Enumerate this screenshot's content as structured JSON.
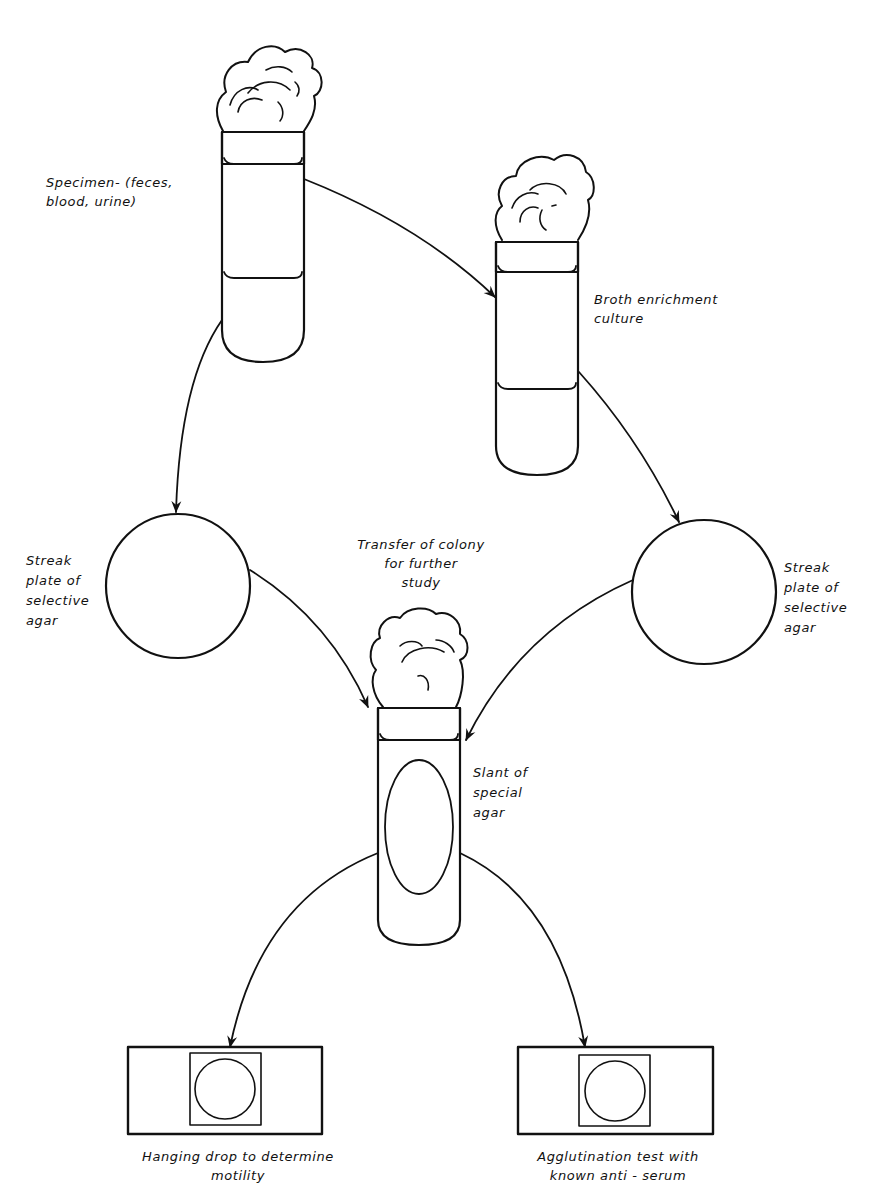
{
  "diagram": {
    "type": "flowchart",
    "colors": {
      "line": "#111111",
      "background": "#ffffff"
    },
    "nodes": {
      "specimen_tube": {
        "label": "Specimen- (feces,\nblood, urine)"
      },
      "broth_tube": {
        "label": "Broth enrichment\nculture"
      },
      "streak_left": {
        "label": "Streak\nplate of\nselective\nagar"
      },
      "streak_right": {
        "label": "Streak\nplate of\nselective\nagar"
      },
      "transfer_note": {
        "label": "Transfer of colony\nfor further\nstudy"
      },
      "slant_tube": {
        "label": "Slant of\nspecial\nagar"
      },
      "hanging_drop_slide": {
        "label": "Hanging drop to determine\nmotility"
      },
      "agglutination_slide": {
        "label": "Agglutination test with\nknown anti - serum"
      }
    },
    "edges": [
      {
        "from": "specimen_tube",
        "to": "broth_tube"
      },
      {
        "from": "specimen_tube",
        "to": "streak_left"
      },
      {
        "from": "broth_tube",
        "to": "streak_right"
      },
      {
        "from": "streak_left",
        "to": "slant_tube"
      },
      {
        "from": "streak_right",
        "to": "slant_tube"
      },
      {
        "from": "slant_tube",
        "to": "hanging_drop_slide"
      },
      {
        "from": "slant_tube",
        "to": "agglutination_slide"
      }
    ]
  }
}
